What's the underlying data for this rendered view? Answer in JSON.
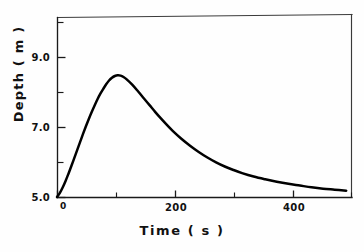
{
  "chart_data": {
    "type": "line",
    "title": "",
    "xlabel": "Time  ( s )",
    "ylabel": "Depth  ( m )",
    "xlim": [
      0,
      510
    ],
    "ylim": [
      5.0,
      10.25
    ],
    "grid": false,
    "legend": null,
    "x_ticks_major": [
      {
        "value": 0,
        "label": "0"
      },
      {
        "value": 200,
        "label": "200"
      },
      {
        "value": 400,
        "label": "400"
      }
    ],
    "x_ticks_minor": [
      100,
      300,
      500
    ],
    "y_ticks_major": [
      {
        "value": 5.0,
        "label": "5.0"
      },
      {
        "value": 7.0,
        "label": "7.0"
      },
      {
        "value": 9.0,
        "label": "9.0"
      }
    ],
    "y_ticks_minor": [
      6.0,
      8.0,
      10.0
    ],
    "series": [
      {
        "name": "depth",
        "color": "#000000",
        "x": [
          0,
          5,
          10,
          15,
          20,
          25,
          30,
          35,
          40,
          45,
          50,
          55,
          60,
          65,
          70,
          75,
          80,
          85,
          90,
          95,
          100,
          105,
          110,
          115,
          120,
          130,
          140,
          150,
          160,
          170,
          180,
          190,
          200,
          215,
          230,
          245,
          260,
          275,
          290,
          305,
          320,
          340,
          360,
          380,
          400,
          420,
          440,
          460,
          480,
          500
        ],
        "y": [
          5.0,
          5.12,
          5.28,
          5.47,
          5.68,
          5.9,
          6.13,
          6.36,
          6.59,
          6.82,
          7.04,
          7.25,
          7.45,
          7.64,
          7.82,
          7.98,
          8.12,
          8.25,
          8.36,
          8.44,
          8.49,
          8.51,
          8.5,
          8.46,
          8.4,
          8.24,
          8.05,
          7.85,
          7.65,
          7.45,
          7.26,
          7.08,
          6.91,
          6.68,
          6.48,
          6.3,
          6.14,
          6.0,
          5.88,
          5.78,
          5.69,
          5.59,
          5.51,
          5.44,
          5.38,
          5.33,
          5.28,
          5.24,
          5.21,
          5.18
        ]
      }
    ]
  },
  "plot": {
    "geometry": {
      "left": 57,
      "right": 352,
      "top": 15,
      "bottom": 197
    }
  }
}
